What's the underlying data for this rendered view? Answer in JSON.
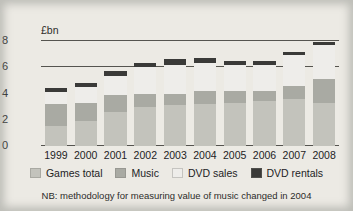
{
  "chart_data": {
    "type": "bar",
    "title": "",
    "subtitle": "",
    "xlabel": "",
    "ylabel": "£bn",
    "ylim": [
      0,
      8
    ],
    "yticks": [
      0,
      2,
      4,
      6,
      8
    ],
    "grid": true,
    "stacked": true,
    "legend_position": "bottom",
    "categories": [
      "1999",
      "2000",
      "2001",
      "2002",
      "2003",
      "2004",
      "2005",
      "2006",
      "2007",
      "2008"
    ],
    "series": [
      {
        "name": "Games total",
        "color": "#c3c3bc",
        "values": [
          1.5,
          1.9,
          2.6,
          3.0,
          3.1,
          3.2,
          3.3,
          3.4,
          3.6,
          3.3
        ]
      },
      {
        "name": "Music",
        "color": "#a9aaa3",
        "values": [
          1.7,
          1.4,
          1.3,
          1.0,
          0.9,
          1.0,
          0.9,
          0.8,
          1.0,
          1.8
        ]
      },
      {
        "name": "DVD sales",
        "color": "#eeedea",
        "values": [
          0.9,
          1.2,
          1.4,
          2.0,
          2.2,
          2.1,
          2.0,
          2.0,
          2.3,
          2.6
        ]
      },
      {
        "name": "DVD rentals",
        "color": "#3a3a38",
        "values": [
          0.3,
          0.3,
          0.4,
          0.3,
          0.4,
          0.4,
          0.3,
          0.3,
          0.3,
          0.2
        ]
      }
    ],
    "totals": [
      4.4,
      4.8,
      5.7,
      6.3,
      6.6,
      6.7,
      6.5,
      6.5,
      7.2,
      7.9
    ],
    "annotations": [
      "NB: methodology for measuring value of music changed in 2004"
    ]
  },
  "axis": {
    "unit_label": "£bn"
  },
  "footnote": {
    "text": "NB: methodology for measuring value of music changed in 2004"
  }
}
